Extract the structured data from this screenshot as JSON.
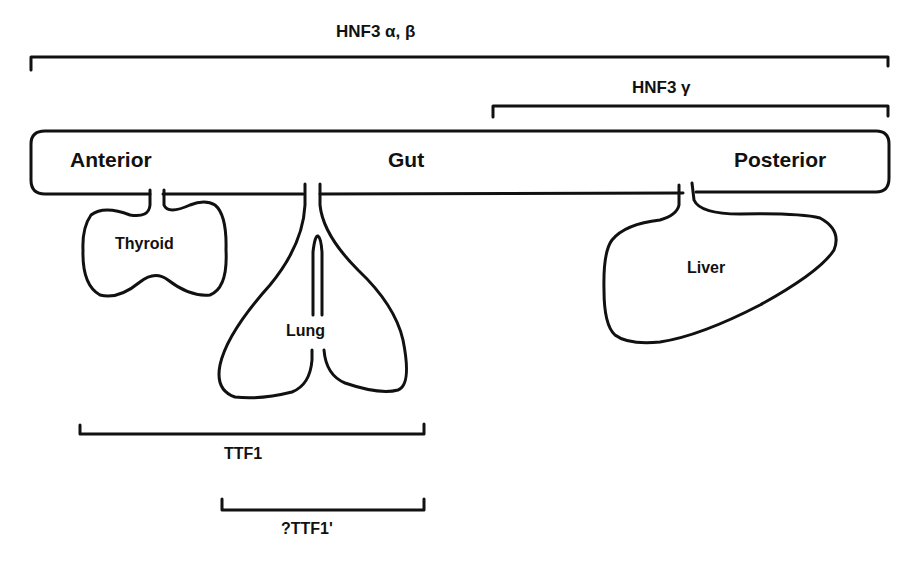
{
  "diagram": {
    "gut": {
      "anterior_label": "Anterior",
      "middle_label": "Gut",
      "posterior_label": "Posterior"
    },
    "organs": [
      {
        "name": "Thyroid",
        "label": "Thyroid"
      },
      {
        "name": "Lung",
        "label": "Lung"
      },
      {
        "name": "Liver",
        "label": "Liver"
      }
    ],
    "expression_domains": [
      {
        "id": "hnf3-alpha-beta",
        "label": "HNF3 α, β",
        "span": "Anterior to Posterior gut"
      },
      {
        "id": "hnf3-gamma",
        "label": "HNF3 γ",
        "span": "Mid to Posterior gut"
      },
      {
        "id": "ttf1",
        "label": "TTF1",
        "span": "Thyroid and Lung"
      },
      {
        "id": "ttf1-prime",
        "label": "?TTF1'",
        "span": "Lung"
      }
    ],
    "colors": {
      "line": "#111111",
      "background": "#ffffff"
    }
  }
}
